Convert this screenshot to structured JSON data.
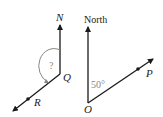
{
  "left_figure": {
    "north_label": "N",
    "vertex_label": "Q",
    "point_label": "R",
    "angle_label": "?"
  },
  "right_figure": {
    "north_label": "North",
    "vertex_label": "O",
    "point_label": "P",
    "angle_label": "50°"
  },
  "colors": {
    "line": "#1a1a1a",
    "arc": "#888888",
    "angle_text": "#888888"
  }
}
